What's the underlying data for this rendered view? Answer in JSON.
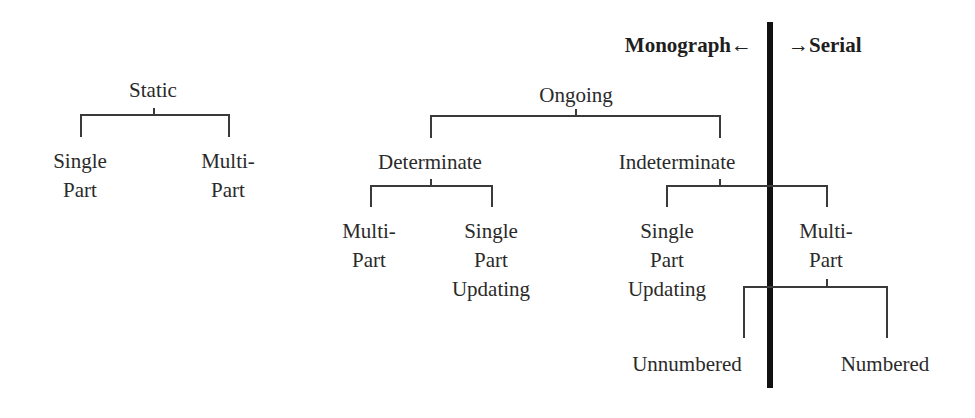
{
  "divider": {
    "left_label": "Monograph←",
    "right_label": "→Serial"
  },
  "tree": {
    "static": {
      "label": "Static",
      "children": [
        {
          "lines": [
            "Single",
            "Part"
          ]
        },
        {
          "lines": [
            "Multi-",
            "Part"
          ]
        }
      ]
    },
    "ongoing": {
      "label": "Ongoing",
      "determinate": {
        "label": "Determinate",
        "children": [
          {
            "lines": [
              "Multi-",
              "Part"
            ]
          },
          {
            "lines": [
              "Single",
              "Part",
              "Updating"
            ]
          }
        ]
      },
      "indeterminate": {
        "label": "Indeterminate",
        "children": [
          {
            "lines": [
              "Single",
              "Part",
              "Updating"
            ]
          },
          {
            "lines": [
              "Multi-",
              "Part"
            ]
          }
        ],
        "multipart_children": [
          {
            "label": "Unnumbered"
          },
          {
            "label": "Numbered"
          }
        ]
      }
    }
  }
}
